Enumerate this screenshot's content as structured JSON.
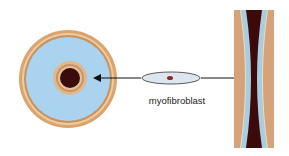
{
  "diagram": {
    "cell_label": "myofibroblast",
    "colors": {
      "outer_ring": "#d9a46e",
      "outer_ring_inner": "#e8b98a",
      "lumen_fill": "#a9d3ee",
      "core_ring": "#d8ae82",
      "core": "#3a0c0c",
      "cell_fill": "#dde6ef",
      "cell_nucleus": "#8b2a22",
      "tube_wall": "#d6a27a",
      "tube_fill": "#a9cde0",
      "tube_core": "#3d0a0a",
      "arrow": "#111111"
    }
  }
}
